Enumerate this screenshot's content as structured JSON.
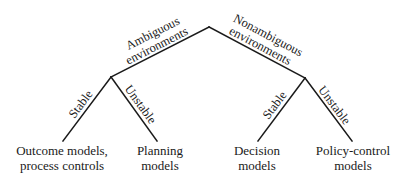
{
  "diagram": {
    "root": {
      "branches": [
        {
          "label_lines": [
            "Ambiguous",
            "environments"
          ],
          "children": [
            {
              "edge_label": "Stable",
              "leaf_lines": [
                "Outcome models,",
                "process controls"
              ]
            },
            {
              "edge_label": "Unstable",
              "leaf_lines": [
                "Planning",
                "models"
              ]
            }
          ]
        },
        {
          "label_lines": [
            "Nonambiguous",
            "environments"
          ],
          "children": [
            {
              "edge_label": "Stable",
              "leaf_lines": [
                "Decision",
                "models"
              ]
            },
            {
              "edge_label": "Unstable",
              "leaf_lines": [
                "Policy-control",
                "models"
              ]
            }
          ]
        }
      ]
    },
    "colors": {
      "line": "#1a1a1a",
      "text": "#1a1a1a",
      "background": "#ffffff"
    }
  }
}
